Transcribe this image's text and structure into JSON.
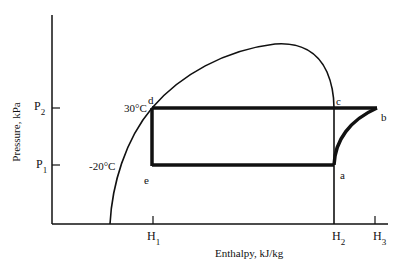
{
  "diagram": {
    "type": "pressure-enthalpy refrigeration cycle",
    "x_axis": {
      "label": "Enthalpy, kJ/kg",
      "ticks": [
        {
          "name": "H",
          "sub": "1"
        },
        {
          "name": "H",
          "sub": "2"
        },
        {
          "name": "H",
          "sub": "3"
        }
      ]
    },
    "y_axis": {
      "label": "Pressure, kPa",
      "ticks": [
        {
          "name": "P",
          "sub": "2"
        },
        {
          "name": "P",
          "sub": "1"
        }
      ]
    },
    "temperatures": {
      "high": "30°C",
      "low": "-20°C"
    },
    "points": {
      "a": "a",
      "b": "b",
      "c": "c",
      "d": "d",
      "e": "e"
    },
    "colors": {
      "line": "#111111",
      "background": "#ffffff"
    }
  }
}
